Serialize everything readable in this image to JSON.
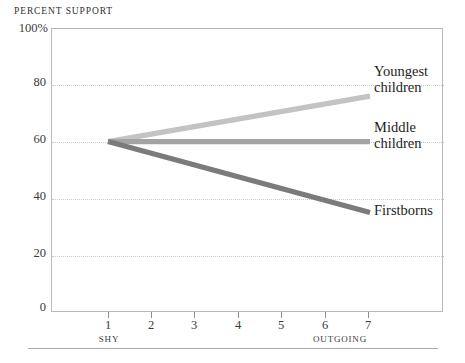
{
  "chart": {
    "axis_title": "PERCENT SUPPORT",
    "y_axis": {
      "label_top": "100%",
      "ticks": [
        "100%",
        "80",
        "60",
        "40",
        "20",
        "0"
      ],
      "tick_values": [
        100,
        80,
        60,
        40,
        20,
        0
      ],
      "min": 0,
      "max": 100
    },
    "x_axis": {
      "ticks": [
        "1",
        "2",
        "3",
        "4",
        "5",
        "6",
        "7"
      ],
      "tick_values": [
        1,
        2,
        3,
        4,
        5,
        6,
        7
      ],
      "caption_left": "SHY",
      "caption_right": "OUTGOING",
      "min": 1,
      "max": 7
    },
    "series_labels": [
      {
        "line1": "Youngest",
        "line2": "children"
      },
      {
        "line1": "Middle",
        "line2": "children"
      },
      {
        "line1": "Firstborns",
        "line2": ""
      }
    ]
  },
  "chart_data": {
    "type": "line",
    "title": "",
    "xlabel": "",
    "ylabel": "PERCENT SUPPORT",
    "xlim": [
      1,
      7
    ],
    "ylim": [
      0,
      100
    ],
    "grid": true,
    "legend_position": "right-inline",
    "x": [
      1,
      7
    ],
    "x_tick_labels": [
      "1",
      "2",
      "3",
      "4",
      "5",
      "6",
      "7"
    ],
    "y_tick_labels": [
      "0",
      "20",
      "40",
      "60",
      "80",
      "100%"
    ],
    "x_axis_annotations": {
      "left": "SHY",
      "right": "OUTGOING"
    },
    "series": [
      {
        "name": "Youngest children",
        "values": [
          60,
          76
        ],
        "color": "#c3c3c3"
      },
      {
        "name": "Middle children",
        "values": [
          60,
          60
        ],
        "color": "#a3a3a3"
      },
      {
        "name": "Firstborns",
        "values": [
          60,
          35
        ],
        "color": "#7b7b7b"
      }
    ]
  },
  "colors": {
    "youngest": "#c3c3c3",
    "middle": "#a3a3a3",
    "firstborns": "#7b7b7b",
    "frame": "#b9b9bd",
    "grid": "#c9c9cc",
    "text": "#2b2b2b"
  }
}
